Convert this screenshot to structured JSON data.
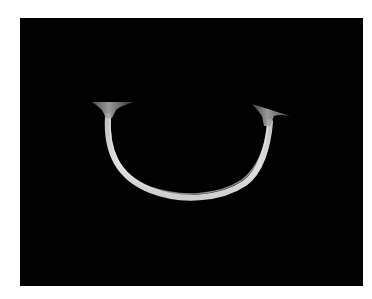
{
  "image": {
    "subject": "curved-bone-xray",
    "background_color": "#020202",
    "page_color": "#ffffff",
    "object_color": "#d8d8d8"
  }
}
